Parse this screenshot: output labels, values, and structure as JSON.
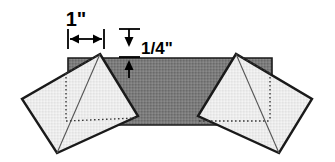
{
  "figure": {
    "background_color": "#ffffff",
    "width": 335,
    "height": 162,
    "annotations": [
      {
        "id": "width-dimension",
        "label": "1\"",
        "value": 1,
        "unit": "inch",
        "orientation": "horizontal",
        "label_x": 86,
        "label_y": 25,
        "line_y": 38,
        "line_x1": 68,
        "line_x2": 104,
        "tick_top": 28,
        "tick_bottom": 48
      },
      {
        "id": "thickness-dimension",
        "label": "1/4\"",
        "value": 0.25,
        "unit": "inch",
        "orientation": "vertical",
        "label_x": 142,
        "label_y": 50,
        "line_x": 129,
        "line_y1": 28,
        "line_y2": 58,
        "extension_x1": 119,
        "extension_x2": 140,
        "arrow_down_tip_y": 46,
        "arrow_up_tip_y": 60,
        "arrow_up_base_y": 75
      }
    ],
    "shapes": [
      {
        "id": "center-bar",
        "name": "horizontal-bar",
        "kind": "rectangle",
        "fill": "#777777",
        "stroke": "#1a1a1a",
        "stroke_width": 1.6,
        "points": "68,58 272,58 272,125 68,125",
        "description": "Dark gray horizontal bar spanning the middle of the figure"
      },
      {
        "id": "left-block",
        "name": "left-rotated-square",
        "kind": "polygon",
        "fill": "#e8e8e8",
        "stroke": "#1a1a1a",
        "stroke_width": 2.2,
        "points": "100,54 138,116 57,153 22,99",
        "diagonal": "100,54 57,153",
        "dotted": "100,54 62,75 62,75 139,116",
        "dotted_vertical": "66,73 66,122",
        "dotted_horizontal": "66,122 136,118",
        "description": "Light gray square rotated counter-clockwise on the left side"
      },
      {
        "id": "right-block",
        "name": "right-rotated-square",
        "kind": "polygon",
        "fill": "#e8e8e8",
        "stroke": "#1a1a1a",
        "stroke_width": 2.2,
        "points": "236,54 198,116 279,153 312,99",
        "diagonal": "236,54 279,153",
        "dotted_vertical": "271,73 271,122",
        "dotted_horizontal": "201,122 271,122",
        "description": "Light gray square rotated clockwise on the right side"
      }
    ],
    "colors": {
      "bar_fill": "#777777",
      "block_fill": "#e8e8e8",
      "outline": "#1a1a1a",
      "dotted_line": "#555555",
      "text": "#000000",
      "background": "#ffffff"
    }
  }
}
